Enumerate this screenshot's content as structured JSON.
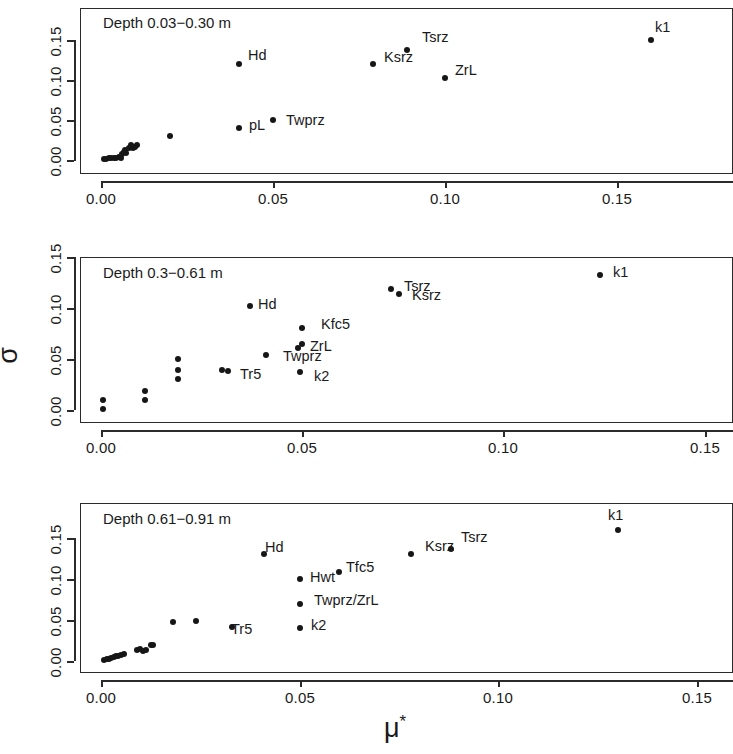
{
  "figure": {
    "x_axis_title": "μ",
    "x_axis_title_superscript": "*",
    "y_axis_title": "σ"
  },
  "chart_data": [
    {
      "type": "scatter",
      "title": "Depth 0.03−0.30 m",
      "xlabel": "μ*",
      "ylabel": "σ",
      "xlim": [
        -0.004,
        0.172
      ],
      "ylim": [
        -0.006,
        0.168
      ],
      "xticks": [
        0.0,
        0.05,
        0.1,
        0.15
      ],
      "xticklabels": [
        "0.00",
        "0.05",
        "0.10",
        "0.15"
      ],
      "yticks": [
        0.0,
        0.05,
        0.1,
        0.15
      ],
      "yticklabels": [
        "0.00",
        "0.05",
        "0.10",
        "0.15"
      ],
      "grid": false,
      "points": [
        {
          "x": 0.001,
          "y": 0.0015,
          "label": ""
        },
        {
          "x": 0.0015,
          "y": 0.0018,
          "label": ""
        },
        {
          "x": 0.0022,
          "y": 0.002,
          "label": ""
        },
        {
          "x": 0.003,
          "y": 0.0022,
          "label": ""
        },
        {
          "x": 0.0038,
          "y": 0.0025,
          "label": ""
        },
        {
          "x": 0.0045,
          "y": 0.003,
          "label": ""
        },
        {
          "x": 0.0052,
          "y": 0.004,
          "label": ""
        },
        {
          "x": 0.0058,
          "y": 0.003,
          "label": ""
        },
        {
          "x": 0.0062,
          "y": 0.007,
          "label": ""
        },
        {
          "x": 0.0066,
          "y": 0.01,
          "label": ""
        },
        {
          "x": 0.007,
          "y": 0.012,
          "label": ""
        },
        {
          "x": 0.0074,
          "y": 0.0085,
          "label": ""
        },
        {
          "x": 0.008,
          "y": 0.015,
          "label": ""
        },
        {
          "x": 0.0086,
          "y": 0.019,
          "label": ""
        },
        {
          "x": 0.0092,
          "y": 0.0155,
          "label": ""
        },
        {
          "x": 0.0098,
          "y": 0.016,
          "label": ""
        },
        {
          "x": 0.0105,
          "y": 0.019,
          "label": ""
        },
        {
          "x": 0.02,
          "y": 0.03,
          "label": ""
        },
        {
          "x": 0.04,
          "y": 0.04,
          "label": "pL"
        },
        {
          "x": 0.05,
          "y": 0.05,
          "label": "Twprz"
        },
        {
          "x": 0.04,
          "y": 0.12,
          "label": "Hd"
        },
        {
          "x": 0.079,
          "y": 0.12,
          "label": "Ksrz"
        },
        {
          "x": 0.089,
          "y": 0.138,
          "label": "Tsrz"
        },
        {
          "x": 0.1,
          "y": 0.102,
          "label": "ZrL"
        },
        {
          "x": 0.16,
          "y": 0.15,
          "label": "k1"
        }
      ]
    },
    {
      "type": "scatter",
      "title": "Depth 0.3−0.61 m",
      "xlabel": "μ*",
      "ylabel": "σ",
      "xlim": [
        -0.004,
        0.158
      ],
      "ylim": [
        -0.006,
        0.16
      ],
      "xticks": [
        0.0,
        0.05,
        0.1,
        0.15
      ],
      "xticklabels": [
        "0.00",
        "0.05",
        "0.10",
        "0.15"
      ],
      "yticks": [
        0.0,
        0.05,
        0.1,
        0.15
      ],
      "yticklabels": [
        "0.00",
        "0.05",
        "0.10",
        "0.15"
      ],
      "grid": false,
      "points": [
        {
          "x": 0.0005,
          "y": 0.0005,
          "label": ""
        },
        {
          "x": 0.0005,
          "y": 0.01,
          "label": ""
        },
        {
          "x": 0.011,
          "y": 0.01,
          "label": ""
        },
        {
          "x": 0.011,
          "y": 0.019,
          "label": ""
        },
        {
          "x": 0.019,
          "y": 0.03,
          "label": ""
        },
        {
          "x": 0.019,
          "y": 0.039,
          "label": ""
        },
        {
          "x": 0.019,
          "y": 0.05,
          "label": ""
        },
        {
          "x": 0.03,
          "y": 0.039,
          "label": "Tr5"
        },
        {
          "x": 0.0315,
          "y": 0.0385,
          "label": ""
        },
        {
          "x": 0.041,
          "y": 0.054,
          "label": ""
        },
        {
          "x": 0.037,
          "y": 0.102,
          "label": "Hd"
        },
        {
          "x": 0.049,
          "y": 0.061,
          "label": "Twprz"
        },
        {
          "x": 0.05,
          "y": 0.065,
          "label": "ZrL"
        },
        {
          "x": 0.05,
          "y": 0.08,
          "label": "Kfc5"
        },
        {
          "x": 0.0495,
          "y": 0.037,
          "label": "k2"
        },
        {
          "x": 0.072,
          "y": 0.119,
          "label": "Tsrz"
        },
        {
          "x": 0.074,
          "y": 0.114,
          "label": "Ksrz"
        },
        {
          "x": 0.124,
          "y": 0.132,
          "label": "k1"
        }
      ]
    },
    {
      "type": "scatter",
      "title": "Depth 0.61−0.91 m",
      "xlabel": "μ*",
      "ylabel": "σ",
      "xlim": [
        -0.004,
        0.158
      ],
      "ylim": [
        -0.006,
        0.178
      ],
      "xticks": [
        0.0,
        0.05,
        0.1,
        0.15
      ],
      "xticklabels": [
        "0.00",
        "0.05",
        "0.10",
        "0.15"
      ],
      "yticks": [
        0.0,
        0.05,
        0.1,
        0.15
      ],
      "yticklabels": [
        "0.00",
        "0.05",
        "0.10",
        "0.15"
      ],
      "grid": false,
      "points": [
        {
          "x": 0.0008,
          "y": 0.0015,
          "label": ""
        },
        {
          "x": 0.0014,
          "y": 0.002,
          "label": ""
        },
        {
          "x": 0.002,
          "y": 0.0025,
          "label": ""
        },
        {
          "x": 0.0026,
          "y": 0.0035,
          "label": ""
        },
        {
          "x": 0.0032,
          "y": 0.0045,
          "label": ""
        },
        {
          "x": 0.0038,
          "y": 0.006,
          "label": ""
        },
        {
          "x": 0.0044,
          "y": 0.0055,
          "label": ""
        },
        {
          "x": 0.005,
          "y": 0.0075,
          "label": ""
        },
        {
          "x": 0.0058,
          "y": 0.008,
          "label": ""
        },
        {
          "x": 0.009,
          "y": 0.013,
          "label": ""
        },
        {
          "x": 0.0098,
          "y": 0.015,
          "label": ""
        },
        {
          "x": 0.0105,
          "y": 0.0125,
          "label": ""
        },
        {
          "x": 0.0112,
          "y": 0.014,
          "label": ""
        },
        {
          "x": 0.0125,
          "y": 0.019,
          "label": ""
        },
        {
          "x": 0.0132,
          "y": 0.0195,
          "label": ""
        },
        {
          "x": 0.018,
          "y": 0.048,
          "label": ""
        },
        {
          "x": 0.024,
          "y": 0.049,
          "label": ""
        },
        {
          "x": 0.033,
          "y": 0.042,
          "label": "Tr5"
        },
        {
          "x": 0.041,
          "y": 0.13,
          "label": "Hd"
        },
        {
          "x": 0.05,
          "y": 0.1,
          "label": "Hwt"
        },
        {
          "x": 0.06,
          "y": 0.108,
          "label": "Tfc5"
        },
        {
          "x": 0.05,
          "y": 0.07,
          "label": "Twprz/ZrL"
        },
        {
          "x": 0.05,
          "y": 0.04,
          "label": "k2"
        },
        {
          "x": 0.078,
          "y": 0.13,
          "label": "Ksrz"
        },
        {
          "x": 0.088,
          "y": 0.136,
          "label": "Tsrz"
        },
        {
          "x": 0.13,
          "y": 0.16,
          "label": "k1"
        }
      ]
    }
  ],
  "panels": [
    {
      "title": "Depth 0.03−0.30 m",
      "labels": [
        {
          "text": "Hd",
          "x": 248,
          "y": 48
        },
        {
          "text": "pL",
          "x": 249,
          "y": 118
        },
        {
          "text": "Twprz",
          "x": 286,
          "y": 113
        },
        {
          "text": "Ksrz",
          "x": 384,
          "y": 50
        },
        {
          "text": "Tsrz",
          "x": 422,
          "y": 30
        },
        {
          "text": "ZrL",
          "x": 455,
          "y": 63
        },
        {
          "text": "k1",
          "x": 655,
          "y": 20
        }
      ]
    },
    {
      "title": "Depth 0.3−0.61 m",
      "labels": [
        {
          "text": "Hd",
          "x": 258,
          "y": 297
        },
        {
          "text": "Tr5",
          "x": 240,
          "y": 367
        },
        {
          "text": "Kfc5",
          "x": 321,
          "y": 317
        },
        {
          "text": "ZrL",
          "x": 310,
          "y": 339
        },
        {
          "text": "Twprz",
          "x": 283,
          "y": 349
        },
        {
          "text": "k2",
          "x": 314,
          "y": 369
        },
        {
          "text": "Tsrz",
          "x": 404,
          "y": 279
        },
        {
          "text": "Ksrz",
          "x": 412,
          "y": 288
        },
        {
          "text": "k1",
          "x": 613,
          "y": 265
        }
      ]
    },
    {
      "title": "Depth 0.61−0.91 m",
      "labels": [
        {
          "text": "Hd",
          "x": 265,
          "y": 540
        },
        {
          "text": "Tr5",
          "x": 231,
          "y": 622
        },
        {
          "text": "Hwt",
          "x": 310,
          "y": 570
        },
        {
          "text": "Tfc5",
          "x": 346,
          "y": 560
        },
        {
          "text": "Twprz/ZrL",
          "x": 314,
          "y": 593
        },
        {
          "text": "k2",
          "x": 311,
          "y": 618
        },
        {
          "text": "Ksrz",
          "x": 425,
          "y": 539
        },
        {
          "text": "Tsrz",
          "x": 461,
          "y": 530
        },
        {
          "text": "k1",
          "x": 608,
          "y": 508
        }
      ]
    }
  ]
}
